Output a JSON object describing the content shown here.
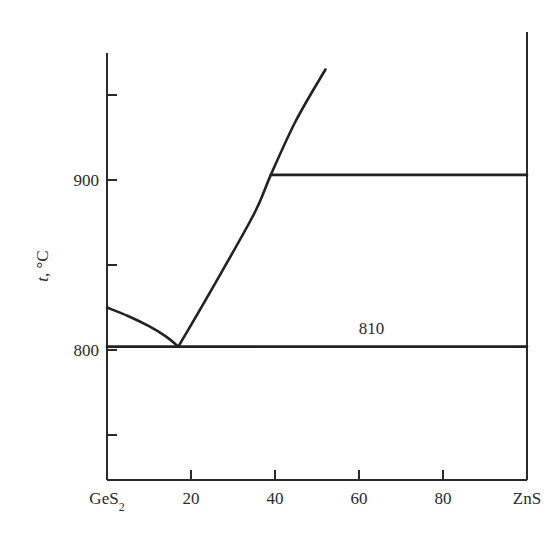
{
  "chart_data": {
    "type": "line",
    "title": "",
    "xlabel": "",
    "ylabel": "t, °C",
    "ylabel_italic_part": "t",
    "ylabel_rest": ", °C",
    "xlim": [
      0,
      100
    ],
    "ylim": [
      724,
      975
    ],
    "grid": false,
    "legend": null,
    "x_ticks": [
      {
        "value": 0,
        "label": "GeS",
        "sub": "2"
      },
      {
        "value": 20,
        "label": "20"
      },
      {
        "value": 40,
        "label": "40"
      },
      {
        "value": 60,
        "label": "60"
      },
      {
        "value": 80,
        "label": "80"
      },
      {
        "value": 100,
        "label": "ZnS"
      }
    ],
    "y_ticks": [
      {
        "value": 750,
        "label": ""
      },
      {
        "value": 800,
        "label": "800"
      },
      {
        "value": 850,
        "label": ""
      },
      {
        "value": 900,
        "label": "900"
      },
      {
        "value": 950,
        "label": ""
      }
    ],
    "series": [
      {
        "name": "liquidus-GeS2-side",
        "x": [
          0,
          5,
          10,
          14,
          17
        ],
        "y": [
          825,
          820,
          814,
          808,
          802
        ]
      },
      {
        "name": "liquidus-ZnS-side",
        "x": [
          17,
          25,
          35,
          39,
          45,
          52
        ],
        "y": [
          802,
          836,
          880,
          903,
          935,
          965
        ]
      },
      {
        "name": "eutectic-line",
        "x": [
          0,
          100
        ],
        "y": [
          802,
          802
        ]
      },
      {
        "name": "upper-horizontal",
        "x": [
          39,
          100
        ],
        "y": [
          903,
          903
        ]
      }
    ],
    "annotations": [
      {
        "text": "810",
        "x": 63,
        "y": 810
      }
    ],
    "components": [
      "GeS2",
      "ZnS"
    ]
  }
}
